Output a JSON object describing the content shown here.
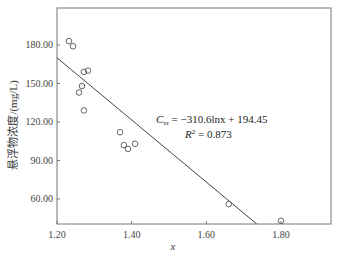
{
  "chart_data": {
    "type": "scatter",
    "title": "",
    "xlabel": "x",
    "ylabel": "悬浮物浓度/(mg/L)",
    "xlim": [
      1.2,
      1.934
    ],
    "ylim": [
      40.5,
      208.8
    ],
    "x_ticks": [
      "1.20",
      "1.40",
      "1.60",
      "1.80"
    ],
    "y_ticks": [
      "180.00",
      "150.00",
      "120.00",
      "90.00",
      "60.00"
    ],
    "grid": false,
    "legend": null,
    "series": [
      {
        "name": "observed",
        "marker": "open-circle",
        "points": [
          {
            "x": 1.232,
            "y": 183
          },
          {
            "x": 1.243,
            "y": 179
          },
          {
            "x": 1.259,
            "y": 143
          },
          {
            "x": 1.267,
            "y": 148
          },
          {
            "x": 1.272,
            "y": 159
          },
          {
            "x": 1.283,
            "y": 160
          },
          {
            "x": 1.272,
            "y": 129
          },
          {
            "x": 1.369,
            "y": 112
          },
          {
            "x": 1.379,
            "y": 102
          },
          {
            "x": 1.39,
            "y": 99
          },
          {
            "x": 1.409,
            "y": 103
          },
          {
            "x": 1.66,
            "y": 56
          },
          {
            "x": 1.8,
            "y": 43
          }
        ]
      },
      {
        "name": "fit",
        "type": "line",
        "points": [
          {
            "x": 1.2,
            "y": 170
          },
          {
            "x": 1.735,
            "y": 40.5
          }
        ]
      }
    ],
    "annotations": [
      {
        "text": "C_ss = −310.6lnx + 194.45",
        "x": 1.53,
        "y": 121
      },
      {
        "text": "R² = 0.873",
        "x": 1.56,
        "y": 113
      }
    ]
  },
  "annotation": {
    "eq_var": "C",
    "eq_sub": "ss",
    "eq_rhs": " = −310.6lnx + 194.45",
    "r2_var": "R",
    "r2_sup": "2",
    "r2_rhs": " = 0.873"
  }
}
